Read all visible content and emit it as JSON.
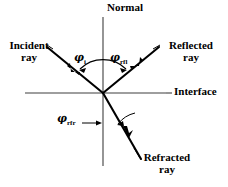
{
  "figure": {
    "background_color": "#ffffff",
    "stroke_color": "#000000",
    "axis_color": "#3a3a3a"
  },
  "labels": {
    "normal": "Normal",
    "interface": "Interface",
    "incident_line1": "Incident",
    "incident_line2": "ray",
    "reflected_line1": "Reflected",
    "reflected_line2": "ray",
    "refracted_line1": "Refracted",
    "refracted_line2": "ray"
  },
  "angles": {
    "incident_symbol": "φ",
    "incident_subscript": "i",
    "reflected_symbol": "φ",
    "reflected_subscript": "rfl",
    "refracted_symbol": "φ",
    "refracted_subscript": "rfr"
  },
  "diagram_data": {
    "type": "diagram",
    "origin": {
      "x": 103,
      "y": 93
    },
    "normal_line": {
      "x": 103,
      "y_top": 17,
      "y_bottom": 166
    },
    "interface_line": {
      "y": 93,
      "x_left": 25,
      "x_right": 166
    },
    "rays": [
      {
        "name": "incident",
        "from": {
          "x": 48,
          "y": 48
        },
        "to": {
          "x": 103,
          "y": 93
        },
        "arrow_at": {
          "x": 72,
          "y": 68
        },
        "direction": "toward-origin"
      },
      {
        "name": "reflected",
        "from": {
          "x": 103,
          "y": 93
        },
        "to": {
          "x": 158,
          "y": 48
        },
        "arrow_at": {
          "x": 138,
          "y": 63
        },
        "direction": "away-from-origin"
      },
      {
        "name": "refracted",
        "from": {
          "x": 103,
          "y": 93
        },
        "to": {
          "x": 140,
          "y": 157
        },
        "arrow_at": {
          "x": 124,
          "y": 131
        },
        "direction": "away-from-origin"
      }
    ],
    "angle_arc": {
      "center": {
        "x": 103,
        "y": 93
      },
      "radius": 33,
      "spans_both_incident_and_reflected": true,
      "double_headed": true
    },
    "refracted_arc": {
      "center": {
        "x": 103,
        "y": 93
      },
      "radius": 36,
      "between": [
        "normal-downward",
        "refracted-ray"
      ]
    }
  }
}
